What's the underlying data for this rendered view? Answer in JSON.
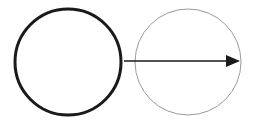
{
  "diagram": {
    "canvas": {
      "width": 253,
      "height": 121,
      "background": "#ffffff"
    },
    "circles": [
      {
        "id": "circle-left",
        "cx": 68,
        "cy": 62,
        "r": 53,
        "stroke": "#1a1a1a",
        "stroke_width": 3
      },
      {
        "id": "circle-right",
        "cx": 188,
        "cy": 62,
        "r": 53,
        "stroke": "#9a9a9a",
        "stroke_width": 1
      }
    ],
    "arrow": {
      "x1": 124,
      "y1": 61,
      "x2": 240,
      "y2": 61,
      "color": "#1a1a1a",
      "stroke_width": 1.5,
      "head": "filled-triangle"
    }
  }
}
